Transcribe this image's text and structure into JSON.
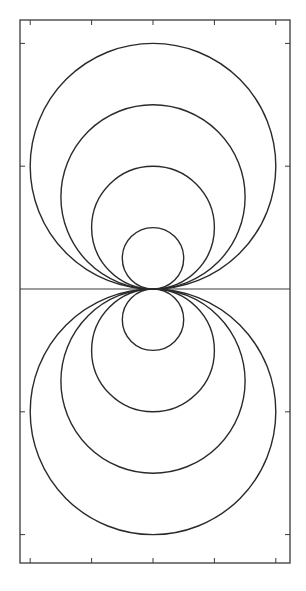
{
  "figure": {
    "background": "#ffffff",
    "ink_color": "#2a2a2a",
    "frame_color": "#3a3a3a"
  },
  "chart_data": {
    "type": "line",
    "title": "",
    "xlabel": "",
    "ylabel": "",
    "xlim": [
      -4.33,
      4.46
    ],
    "ylim": [
      -8.92,
      8.76
    ],
    "grid": false,
    "legend": null,
    "x_ticks": [
      -4,
      -2,
      0,
      2,
      4
    ],
    "y_ticks": [
      8,
      4,
      -4,
      -8
    ],
    "tick_labels_visible": false,
    "horizontal_axis_line": {
      "y": 0
    },
    "series": [
      {
        "name": "upper-circle-r1",
        "center": [
          0,
          1
        ],
        "radius": 1
      },
      {
        "name": "upper-circle-r2",
        "center": [
          0,
          2
        ],
        "radius": 2
      },
      {
        "name": "upper-circle-r3",
        "center": [
          0,
          3
        ],
        "radius": 3
      },
      {
        "name": "upper-circle-r4",
        "center": [
          0,
          4
        ],
        "radius": 4
      },
      {
        "name": "lower-circle-r1",
        "center": [
          0,
          -1
        ],
        "radius": 1
      },
      {
        "name": "lower-circle-r2",
        "center": [
          0,
          -2
        ],
        "radius": 2
      },
      {
        "name": "lower-circle-r3",
        "center": [
          0,
          -3
        ],
        "radius": 3
      },
      {
        "name": "lower-circle-r4",
        "center": [
          0,
          -4
        ],
        "radius": 4
      }
    ]
  },
  "layout": {
    "frame": {
      "left": 20,
      "top": 20,
      "right": 290,
      "bottom": 563
    },
    "origin_px": [
      153,
      289
    ],
    "unit_px": 30.7,
    "tick_length_px": 5
  }
}
